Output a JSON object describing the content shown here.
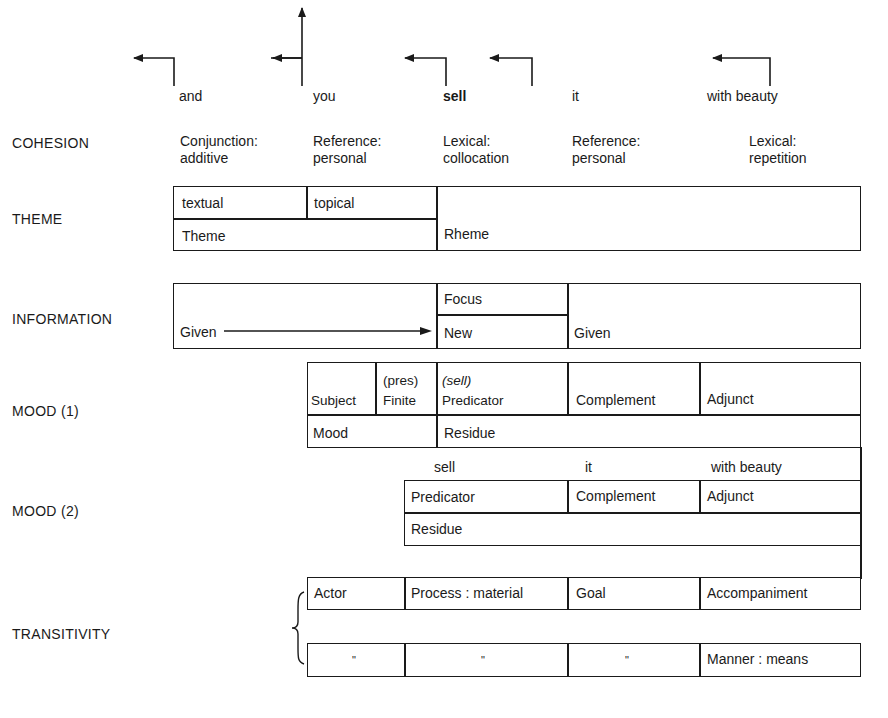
{
  "clause_words": [
    {
      "text": "and",
      "bold": false
    },
    {
      "text": "you",
      "bold": false
    },
    {
      "text": "sell",
      "bold": true
    },
    {
      "text": "it",
      "bold": false
    },
    {
      "text": "with beauty",
      "bold": false
    }
  ],
  "rows": {
    "cohesion": {
      "label": "COHESION",
      "items": [
        {
          "line1": "Conjunction:",
          "line2": "additive"
        },
        {
          "line1": "Reference:",
          "line2": "personal"
        },
        {
          "line1": "Lexical:",
          "line2": "collocation"
        },
        {
          "line1": "Reference:",
          "line2": "personal"
        },
        {
          "line1": "Lexical:",
          "line2": "repetition"
        }
      ]
    },
    "theme": {
      "label": "THEME",
      "textual": "textual",
      "topical": "topical",
      "theme": "Theme",
      "rheme": "Rheme"
    },
    "information": {
      "label": "INFORMATION",
      "given1": "Given",
      "focus": "Focus",
      "new": "New",
      "given2": "Given"
    },
    "mood1": {
      "label": "MOOD (1)",
      "subject": "Subject",
      "finite_top": "(pres)",
      "finite": "Finite",
      "predicator_top": "(sell)",
      "predicator": "Predicator",
      "complement": "Complement",
      "adjunct": "Adjunct",
      "mood": "Mood",
      "residue": "Residue"
    },
    "mood2": {
      "label": "MOOD (2)",
      "words": [
        "sell",
        "it",
        "with beauty"
      ],
      "predicator": "Predicator",
      "complement": "Complement",
      "adjunct": "Adjunct",
      "residue": "Residue"
    },
    "transitivity": {
      "label": "TRANSITIVITY",
      "row1": [
        "Actor",
        "Process : material",
        "Goal",
        "Accompaniment"
      ],
      "row2": [
        "\"",
        "\"",
        "\"",
        "Manner : means"
      ]
    }
  }
}
